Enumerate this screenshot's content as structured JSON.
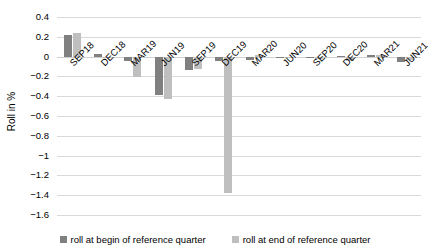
{
  "chart_data": {
    "type": "bar",
    "title": "",
    "xlabel": "",
    "ylabel": "Roll in %",
    "ylim": [
      -1.6,
      0.4
    ],
    "ytick_labels": [
      "0.4",
      "0.2",
      "0",
      "−0.2",
      "−0.4",
      "−0.6",
      "−0.8",
      "−1",
      "−1.2",
      "−1.4",
      "−1.6"
    ],
    "ytick_values": [
      0.4,
      0.2,
      0,
      -0.2,
      -0.4,
      -0.6,
      -0.8,
      -1,
      -1.2,
      -1.4,
      -1.6
    ],
    "grid": true,
    "legend_position": "bottom",
    "categories": [
      "SEP18",
      "DEC18",
      "MAR19",
      "JUN19",
      "SEP19",
      "DEC19",
      "MAR20",
      "JUN20",
      "SEP20",
      "DEC20",
      "MAR21",
      "JUN21"
    ],
    "series": [
      {
        "name": "roll at begin of reference quarter",
        "color": "#808080",
        "values": [
          0.22,
          0.03,
          -0.04,
          -0.39,
          -0.14,
          -0.04,
          -0.03,
          -0.005,
          -0.005,
          0.01,
          0.02,
          -0.05
        ]
      },
      {
        "name": "roll at end of reference quarter",
        "color": "#bfbfbf",
        "values": [
          0.24,
          0.0,
          -0.21,
          -0.43,
          -0.13,
          -1.38,
          0.02,
          -0.01,
          -0.02,
          -0.04,
          0.02,
          -0.03
        ]
      }
    ]
  },
  "legend": {
    "items": [
      {
        "label": "roll at begin of reference quarter",
        "color": "#808080"
      },
      {
        "label": "roll at end of reference quarter",
        "color": "#bfbfbf"
      }
    ]
  },
  "axis": {
    "y_title": "Roll in %"
  }
}
